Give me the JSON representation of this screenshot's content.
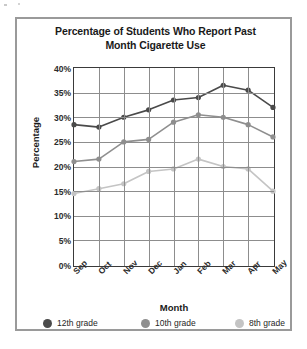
{
  "chart_data": {
    "type": "line",
    "title": "Percentage of Students Who Report Past Month Cigarette Use",
    "title_line1": "Percentage of Students Who Report Past",
    "title_line2": "Month Cigarette Use",
    "xlabel": "Month",
    "ylabel": "Percentage",
    "categories": [
      "Sep",
      "Oct",
      "Nov",
      "Dec",
      "Jan",
      "Feb",
      "Mar",
      "Apr",
      "May"
    ],
    "ylim": [
      0,
      40
    ],
    "ytick_values": [
      0,
      5,
      10,
      15,
      20,
      25,
      30,
      35,
      40
    ],
    "ytick_labels": [
      "0%",
      "5%",
      "10%",
      "15%",
      "20%",
      "25%",
      "30%",
      "35%",
      "40%"
    ],
    "grid": true,
    "legend_position": "bottom",
    "series": [
      {
        "name": "12th grade",
        "color": "#4a4a4a",
        "values": [
          28.5,
          28.0,
          30.0,
          31.5,
          33.5,
          34.0,
          36.5,
          35.5,
          32.0
        ]
      },
      {
        "name": "10th grade",
        "color": "#8f8f8f",
        "values": [
          21.0,
          21.5,
          25.0,
          25.5,
          29.0,
          30.5,
          30.0,
          28.5,
          26.0
        ]
      },
      {
        "name": "8th grade",
        "color": "#c4c4c4",
        "values": [
          14.5,
          15.5,
          16.5,
          19.0,
          19.5,
          21.5,
          20.0,
          19.5,
          15.0
        ]
      }
    ]
  },
  "colors": {
    "frame_border": "#9a9a9a",
    "plot_border": "#3a3a3a",
    "gridline": "#8d8d8d",
    "text": "#1a1a1a",
    "background": "#ffffff"
  }
}
